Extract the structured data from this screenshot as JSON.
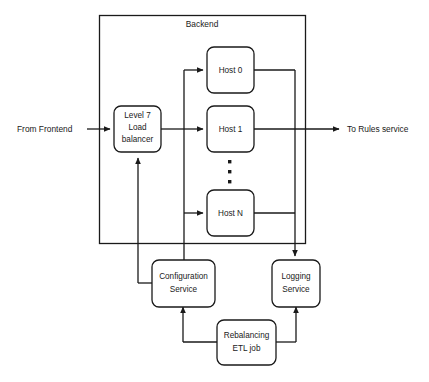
{
  "diagram": {
    "group": {
      "label": "Backend"
    },
    "nodes": {
      "load_balancer": {
        "line1": "Level 7",
        "line2": "Load",
        "line3": "balancer"
      },
      "host0": {
        "label": "Host 0"
      },
      "host1": {
        "label": "Host 1"
      },
      "hostn": {
        "label": "Host N"
      },
      "configuration_service": {
        "line1": "Configuration",
        "line2": "Service"
      },
      "logging_service": {
        "line1": "Logging",
        "line2": "Service"
      },
      "rebalancing_etl": {
        "line1": "Rebalancing",
        "line2": "ETL job"
      }
    },
    "edge_labels": {
      "from_frontend": "From Frontend",
      "to_rules_service": "To Rules service"
    },
    "ellipsis": {
      "label": "vertical-ellipsis",
      "count": 3
    },
    "colors": {
      "stroke": "#1a1a1a",
      "fill": "#ffffff",
      "background": "#ffffff",
      "text": "#1a1a1a"
    }
  }
}
